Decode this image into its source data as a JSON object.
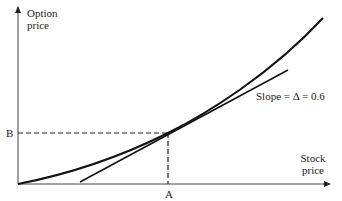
{
  "diagram": {
    "type": "option-delta-tangent",
    "y_axis": {
      "label_line1": "Option",
      "label_line2": "price"
    },
    "x_axis": {
      "label_line1": "Stock",
      "label_line2": "price"
    },
    "tangent_label": "Slope = Δ = 0.6",
    "point_x_label": "A",
    "point_y_label": "B",
    "colors": {
      "line": "#222222",
      "background": "#ffffff"
    }
  }
}
